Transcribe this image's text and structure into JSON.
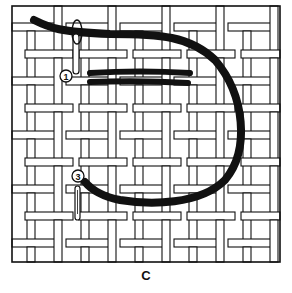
{
  "figure": {
    "caption": "C",
    "colors": {
      "ink": "#111111",
      "paper": "#ffffff"
    },
    "labels": [
      {
        "id": "step-1",
        "text": "1"
      },
      {
        "id": "step-3",
        "text": "3"
      }
    ],
    "elements": {
      "canvas": "interwoven canvas mesh",
      "thread": "working thread",
      "needle_top": "needle (step 1)",
      "needle_bottom": "needle (step 3)",
      "stitches": "completed stitches"
    }
  }
}
